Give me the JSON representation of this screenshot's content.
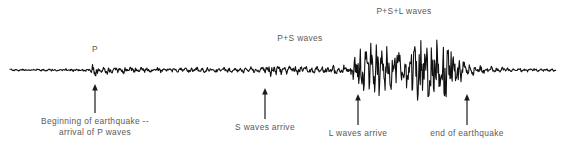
{
  "figure": {
    "type": "seismogram",
    "trace_color": "#111111",
    "label_color": "#59595b",
    "background": "#ffffff",
    "baseline_y": 70
  },
  "wave_labels": [
    {
      "id": "p-wave",
      "text": "P",
      "x": 95,
      "y": 44
    },
    {
      "id": "p-s-waves",
      "text": "P+S waves",
      "x": 300,
      "y": 33
    },
    {
      "id": "p-s-l-waves",
      "text": "P+S+L waves",
      "x": 404,
      "y": 6
    }
  ],
  "arrow_annotations": [
    {
      "id": "beginning-of-earthquake",
      "lines": [
        "Beginning of earthquake --",
        "arrival of P waves"
      ],
      "arrow_x": 95,
      "arrow_top_y": 84,
      "arrow_bottom_y": 113,
      "label_x": 95,
      "label_y": 116,
      "multiline": true
    },
    {
      "id": "s-waves-arrive",
      "lines": [
        "S waves arrive"
      ],
      "arrow_x": 265,
      "arrow_top_y": 88,
      "arrow_bottom_y": 119,
      "label_x": 265,
      "label_y": 122,
      "multiline": false
    },
    {
      "id": "l-waves-arrive",
      "lines": [
        "L waves arrive"
      ],
      "arrow_x": 358,
      "arrow_top_y": 94,
      "arrow_bottom_y": 125,
      "label_x": 358,
      "label_y": 128,
      "multiline": false
    },
    {
      "id": "end-of-earthquake",
      "lines": [
        "end of earthquake"
      ],
      "arrow_x": 467,
      "arrow_top_y": 94,
      "arrow_bottom_y": 125,
      "label_x": 467,
      "label_y": 128,
      "multiline": false
    }
  ],
  "chart_data": {
    "type": "line",
    "title": "",
    "xlabel": "",
    "ylabel": "",
    "grid": false,
    "legend": "none",
    "baseline": 70,
    "x_range": [
      10,
      556
    ],
    "amplitude_envelope": [
      {
        "x": 10,
        "amp": 1.2,
        "phase": "pre-event noise"
      },
      {
        "x": 60,
        "amp": 1.6,
        "phase": "pre-event noise"
      },
      {
        "x": 88,
        "amp": 2.0,
        "phase": "pre-event noise"
      },
      {
        "x": 95,
        "amp": 9.0,
        "phase": "P arrival"
      },
      {
        "x": 104,
        "amp": 5.5,
        "phase": "P coda"
      },
      {
        "x": 140,
        "amp": 3.4,
        "phase": "P coda"
      },
      {
        "x": 200,
        "amp": 3.0,
        "phase": "P coda"
      },
      {
        "x": 262,
        "amp": 3.2,
        "phase": "P coda"
      },
      {
        "x": 268,
        "amp": 7.5,
        "phase": "S arrival"
      },
      {
        "x": 285,
        "amp": 5.0,
        "phase": "P+S"
      },
      {
        "x": 320,
        "amp": 4.6,
        "phase": "P+S"
      },
      {
        "x": 350,
        "amp": 5.2,
        "phase": "P+S"
      },
      {
        "x": 360,
        "amp": 24.0,
        "phase": "L arrival"
      },
      {
        "x": 380,
        "amp": 30.0,
        "phase": "P+S+L"
      },
      {
        "x": 395,
        "amp": 20.0,
        "phase": "P+S+L"
      },
      {
        "x": 410,
        "amp": 36.0,
        "phase": "P+S+L peak"
      },
      {
        "x": 430,
        "amp": 33.0,
        "phase": "P+S+L"
      },
      {
        "x": 452,
        "amp": 30.0,
        "phase": "P+S+L"
      },
      {
        "x": 466,
        "amp": 9.0,
        "phase": "coda decay"
      },
      {
        "x": 480,
        "amp": 5.0,
        "phase": "coda decay"
      },
      {
        "x": 510,
        "amp": 2.4,
        "phase": "post-event noise"
      },
      {
        "x": 556,
        "amp": 1.4,
        "phase": "post-event noise"
      }
    ],
    "phase_arrivals": [
      {
        "phase": "P",
        "x": 95,
        "label": "Beginning of earthquake -- arrival of P waves"
      },
      {
        "phase": "S",
        "x": 265,
        "label": "S waves arrive"
      },
      {
        "phase": "L",
        "x": 358,
        "label": "L waves arrive"
      },
      {
        "phase": "end",
        "x": 467,
        "label": "end of earthquake"
      }
    ]
  }
}
